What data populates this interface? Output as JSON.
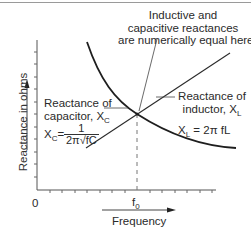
{
  "diagram": {
    "title_annotation": {
      "line1": "Inductive and",
      "line2": "capacitive reactances",
      "line3": "are numerically equal here"
    },
    "y_axis": {
      "label": "Reactance in ohms",
      "tick_count": 11
    },
    "x_axis": {
      "label": "Frequency",
      "origin_label": "0",
      "marker_label": "f",
      "marker_sub": "0",
      "tick_count": 14
    },
    "capacitor_label": {
      "line1": "Reactance of",
      "line2": "capacitor, X",
      "line2_sub": "C"
    },
    "inductor_label": {
      "line1": "Reactance of",
      "line2": "inductor, X",
      "line2_sub": "L"
    },
    "capacitor_formula": {
      "lhs": "X",
      "lhs_sub": "C",
      "eq": "=",
      "numerator": "1",
      "denominator": "2π√fC"
    },
    "inductor_formula": {
      "lhs": "X",
      "lhs_sub": "L",
      "rhs": " = 2π fL"
    },
    "colors": {
      "curve": "#1e1e1e",
      "axis": "#555555",
      "dashed": "#777777",
      "text": "#2a2a2a"
    }
  }
}
